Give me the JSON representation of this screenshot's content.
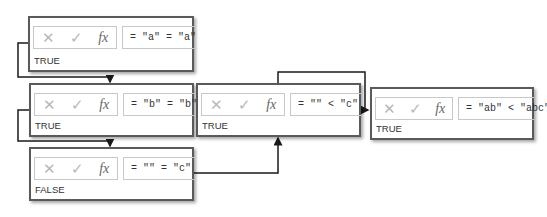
{
  "panels": [
    {
      "id": "p1",
      "formula": "= \"a\" = \"a\"",
      "result": "TRUE"
    },
    {
      "id": "p2",
      "formula": "= \"b\" = \"b\"",
      "result": "TRUE"
    },
    {
      "id": "p3",
      "formula": "= \"\" = \"c\"",
      "result": "FALSE"
    },
    {
      "id": "p4",
      "formula": "= \"\" < \"c\"",
      "result": "TRUE"
    },
    {
      "id": "p5",
      "formula": "= \"ab\" < \"abc\"",
      "result": "TRUE"
    }
  ],
  "icons": {
    "cancel": "✕",
    "enter": "✓",
    "function": "fx"
  },
  "colors": {
    "border": "#5a5a5a",
    "connector": "#1a1a1a",
    "icon_gray": "#b8b8b8"
  }
}
